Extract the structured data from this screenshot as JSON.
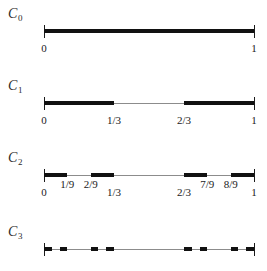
{
  "figure": {
    "background_color": "#ffffff",
    "line_color": "#111111",
    "baseline_color": "#8c8c8c",
    "axis_start_value": 0,
    "axis_end_value": 1
  },
  "chart_data": {
    "type": "bar",
    "xlabel": "",
    "ylabel": "",
    "xlim": [
      0,
      1
    ],
    "grid": false,
    "legend": false,
    "orientation": "horizontal-intervals",
    "categories": [
      "C_0",
      "C_1",
      "C_2",
      "C_3"
    ],
    "series": [
      {
        "name": "C_0",
        "label": "C",
        "subscript": "0",
        "tick_labels": [
          "0",
          "1"
        ],
        "tick_values": [
          0,
          1
        ],
        "tick_levels": [
          "low",
          "low"
        ],
        "intervals": [
          [
            0,
            1
          ]
        ],
        "interval_count": 1,
        "total_length": 1
      },
      {
        "name": "C_1",
        "label": "C",
        "subscript": "1",
        "tick_labels": [
          "0",
          "1/3",
          "2/3",
          "1"
        ],
        "tick_values": [
          0,
          0.3333333333,
          0.6666666667,
          1
        ],
        "tick_levels": [
          "low",
          "low",
          "low",
          "low"
        ],
        "intervals": [
          [
            0,
            0.3333333333
          ],
          [
            0.6666666667,
            1
          ]
        ],
        "interval_count": 2,
        "total_length": 0.6666666667
      },
      {
        "name": "C_2",
        "label": "C",
        "subscript": "2",
        "tick_labels": [
          "0",
          "1/9",
          "2/9",
          "1/3",
          "2/3",
          "7/9",
          "8/9",
          "1"
        ],
        "tick_values": [
          0,
          0.1111111111,
          0.2222222222,
          0.3333333333,
          0.6666666667,
          0.7777777778,
          0.8888888889,
          1
        ],
        "tick_levels": [
          "low",
          "high",
          "high",
          "low",
          "low",
          "high",
          "high",
          "low"
        ],
        "intervals": [
          [
            0,
            0.1111111111
          ],
          [
            0.2222222222,
            0.3333333333
          ],
          [
            0.6666666667,
            0.7777777778
          ],
          [
            0.8888888889,
            1
          ]
        ],
        "interval_count": 4,
        "total_length": 0.4444444444
      },
      {
        "name": "C_3",
        "label": "C",
        "subscript": "3",
        "tick_labels": [],
        "tick_values": [],
        "tick_levels": [],
        "intervals": [
          [
            0,
            0.037037037
          ],
          [
            0.0740740741,
            0.1111111111
          ],
          [
            0.2222222222,
            0.2592592593
          ],
          [
            0.2962962963,
            0.3333333333
          ],
          [
            0.6666666667,
            0.7037037037
          ],
          [
            0.7407407407,
            0.7777777778
          ],
          [
            0.8888888889,
            0.9259259259
          ],
          [
            0.962962963,
            1
          ]
        ],
        "interval_count": 8,
        "total_length": 0.2962962963
      }
    ]
  }
}
